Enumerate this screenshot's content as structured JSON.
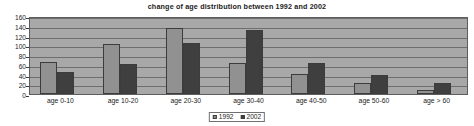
{
  "chart_data": {
    "type": "bar",
    "title": "change of age distribution between 1992 and 2002",
    "xlabel": "",
    "ylabel": "",
    "categories": [
      "age 0-10",
      "age 10-20",
      "age 20-30",
      "age 30-40",
      "age 40-50",
      "age 50-60",
      "age > 60"
    ],
    "series": [
      {
        "name": "1992",
        "color": "#919191",
        "values": [
          65,
          102,
          136,
          63,
          42,
          23,
          9
        ]
      },
      {
        "name": "2002",
        "color": "#3f3f3f",
        "values": [
          45,
          61,
          105,
          131,
          64,
          40,
          22
        ]
      }
    ],
    "ylim": [
      0,
      160
    ],
    "ytick_labels": [
      "160",
      "140",
      "120",
      "100",
      "80",
      "60",
      "40",
      "20",
      "0"
    ],
    "ytick_values": [
      160,
      140,
      120,
      100,
      80,
      60,
      40,
      20,
      0
    ],
    "grid": true,
    "legend_position": "bottom",
    "legend_entries": [
      "1992",
      "2002"
    ],
    "plot_background": "#a8a8a8",
    "axis_color": "#5d5d5d",
    "grid_color": "#6e6e6e"
  }
}
